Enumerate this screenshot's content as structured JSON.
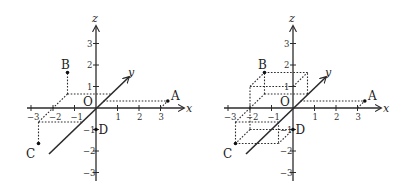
{
  "figures": [
    {
      "id": "left",
      "description": "3D coordinate axes with points A, B, C, D and projection lines",
      "axes": {
        "x_label": "x",
        "y_label": "y",
        "z_label": "z",
        "origin_label": "O"
      },
      "x_ticks": [
        "−3",
        "−2",
        "−1",
        "1",
        "2",
        "3"
      ],
      "z_ticks": [
        "3",
        "2",
        "1",
        "−1",
        "−2",
        "−3"
      ],
      "points": {
        "A": "A",
        "B": "B",
        "C": "C",
        "D": "D"
      }
    },
    {
      "id": "right",
      "description": "3D coordinate axes with points A, B, C, D and rectangular boxes",
      "axes": {
        "x_label": "x",
        "y_label": "y",
        "z_label": "z",
        "origin_label": "O"
      },
      "x_ticks": [
        "−3",
        "−2",
        "−1",
        "1",
        "2",
        "3"
      ],
      "z_ticks": [
        "3",
        "2",
        "1",
        "−1",
        "−2",
        "−3"
      ],
      "points": {
        "A": "A",
        "B": "B",
        "C": "C",
        "D": "D"
      }
    }
  ],
  "point_coordinates": {
    "A": [
      3,
      0.5,
      0
    ],
    "B": [
      -2,
      1,
      1
    ],
    "C": [
      -2,
      -1,
      -1
    ],
    "D": [
      0,
      0,
      -1
    ]
  },
  "colors": {
    "ink": "#2b2b2b",
    "background": "#ffffff"
  }
}
